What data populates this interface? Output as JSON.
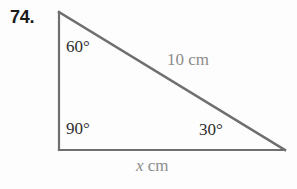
{
  "figure": {
    "problem_number": "74.",
    "shape": "right-triangle",
    "stroke_color": "#6f6f6f",
    "angle_text_color": "#2e2e2e",
    "side_text_color": "#8c8c8c",
    "background_color": "#fdfdfd",
    "vertices": {
      "top_left": {
        "x": 59,
        "y": 12
      },
      "bottom_left": {
        "x": 59,
        "y": 150
      },
      "bottom_right": {
        "x": 285,
        "y": 150
      }
    },
    "angles": [
      {
        "name": "top-left-angle",
        "value": "60°"
      },
      {
        "name": "bottom-left-angle",
        "value": "90°"
      },
      {
        "name": "bottom-right-angle",
        "value": "30°"
      }
    ],
    "sides": [
      {
        "name": "hypotenuse",
        "label": "10 cm",
        "value": "10",
        "unit": "cm"
      },
      {
        "name": "base",
        "label_variable": "x",
        "label_unit": " cm",
        "value": "x",
        "unit": "cm"
      }
    ]
  }
}
